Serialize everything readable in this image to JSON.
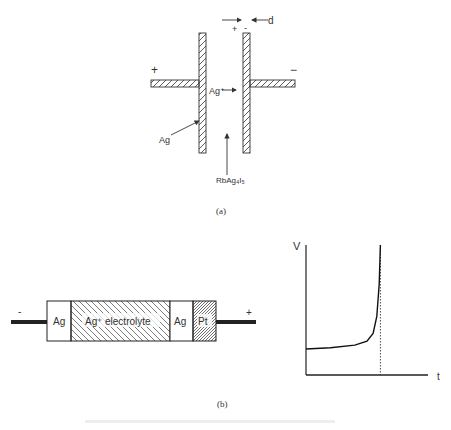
{
  "figure_a": {
    "caption": "(a)",
    "labels": {
      "plus_left": "+",
      "minus_right": "−",
      "ion": "Ag⁺",
      "silver": "Ag",
      "electrolyte": "RbAg₄I₅",
      "gap": "d",
      "gap_plus": "+",
      "gap_minus": "-"
    }
  },
  "figure_b": {
    "caption": "(b)",
    "cell": {
      "terminal_left": "-",
      "terminal_right": "+",
      "segments": [
        "Ag",
        "Ag⁺ electrolyte",
        "Ag",
        "Pt"
      ]
    },
    "graph": {
      "y_label": "V",
      "x_label": "t"
    }
  },
  "chart_data": {
    "type": "line",
    "title": "",
    "xlabel": "t",
    "ylabel": "V",
    "series": [
      {
        "name": "V(t)",
        "x": [
          0,
          0.2,
          0.4,
          0.5,
          0.55,
          0.58,
          0.6,
          0.61
        ],
        "y": [
          0.2,
          0.21,
          0.23,
          0.26,
          0.32,
          0.45,
          0.7,
          1.0
        ]
      }
    ],
    "asymptote_x": 0.61,
    "xlim": [
      0,
      1
    ],
    "ylim": [
      0,
      1
    ],
    "grid": false
  }
}
